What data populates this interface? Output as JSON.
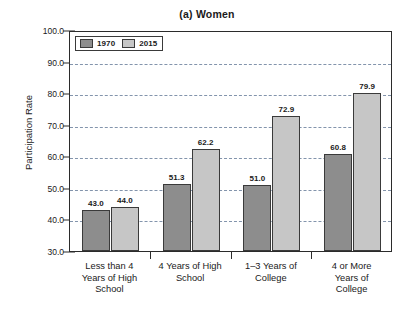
{
  "chart_data": {
    "type": "bar",
    "title": "(a) Women",
    "xlabel": "",
    "ylabel": "Participation Rate",
    "ylim": [
      30.0,
      100.0
    ],
    "ytick_labels": [
      "30.0",
      "40.0",
      "50.0",
      "60.0",
      "70.0",
      "80.0",
      "90.0",
      "100.0"
    ],
    "ytick_values": [
      30.0,
      40.0,
      50.0,
      60.0,
      70.0,
      80.0,
      90.0,
      100.0
    ],
    "grid": "horizontal-dashed",
    "legend_position": "top-left-inside",
    "categories": [
      "Less than 4 Years of High School",
      "4 Years of High School",
      "1–3 Years of College",
      "4 or More Years of College"
    ],
    "category_lines": [
      [
        "Less than 4",
        "Years of High",
        "School"
      ],
      [
        "4 Years of High",
        "School"
      ],
      [
        "1–3 Years of",
        "College"
      ],
      [
        "4 or More",
        "Years of",
        "College"
      ]
    ],
    "series": [
      {
        "name": "1970",
        "color": "#8d8d8d",
        "values": [
          43.0,
          51.3,
          51.0,
          60.8
        ],
        "labels": [
          "43.0",
          "51.3",
          "51.0",
          "60.8"
        ]
      },
      {
        "name": "2015",
        "color": "#c6c6c6",
        "values": [
          44.0,
          62.2,
          72.9,
          79.9
        ],
        "labels": [
          "44.0",
          "62.2",
          "72.9",
          "79.9"
        ]
      }
    ]
  },
  "legend": {
    "entries": [
      {
        "label": "1970"
      },
      {
        "label": "2015"
      }
    ]
  },
  "colors": {
    "series_1970": "#8d8d8d",
    "series_2015": "#c6c6c6",
    "axis": "#2b2b2b",
    "gridline": "#7d8fa8",
    "background": "#ffffff"
  }
}
